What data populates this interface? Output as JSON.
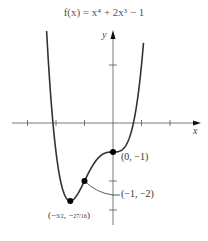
{
  "chart_data": {
    "type": "line",
    "title": "f(x) = x⁴ + 2x³ − 1",
    "function": "x^4 + 2x^3 - 1",
    "xlabel": "x",
    "ylabel": "y",
    "xlim": [
      -3.7,
      3.05
    ],
    "ylim": [
      -3.5,
      3.15
    ],
    "x_ticks": [
      -3,
      -2,
      -1,
      1,
      2
    ],
    "y_ticks": [
      -3,
      -2,
      2
    ],
    "grid": false,
    "legend": null,
    "x_range_plotted": [
      -2.33,
      1.07
    ],
    "points": [
      {
        "x": 0,
        "y": -1,
        "label": "(0, −1)"
      },
      {
        "x": -1,
        "y": -2,
        "label": "(−1, −2)"
      },
      {
        "x": -1.5,
        "y": -2.6875,
        "label": "(−3/2, −27/16)"
      }
    ],
    "annotations": [
      "(0, −1)",
      "(−1, −2)",
      "(−3/2, −27/16)"
    ]
  },
  "labels": {
    "title": "f(x) = x⁴ + 2x³ − 1",
    "x_axis": "x",
    "y_axis": "y",
    "point_origin": "(0, −1)",
    "point_inflection": "(−1, −2)",
    "point_min": "(−3/2, −27/16)"
  },
  "colors": {
    "curve": "#333333",
    "axes": "#555555",
    "text": "#333333"
  }
}
